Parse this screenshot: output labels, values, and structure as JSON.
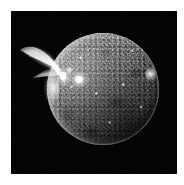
{
  "image": {
    "kind": "astronomical-photograph",
    "subject": "solar-disk-with-erupting-prominence",
    "color_mode": "grayscale",
    "background_color": "#ffffff",
    "frame_color": "#040404",
    "alt_text": "Grayscale solar image: mottled solar disk on a black field with a large wing-shaped prominence erupting from the upper-left limb"
  },
  "layout": {
    "canvas": {
      "width": 184,
      "height": 185
    },
    "frame": {
      "left": 11,
      "top": 11,
      "width": 166,
      "height": 163
    },
    "disk": {
      "center_x": 103,
      "center_y": 89,
      "radius": 56
    }
  },
  "features": {
    "disk_label": "solar disk",
    "prominence_label": "erupting prominence",
    "active_regions": [
      {
        "name": "bright plage (disk centre-left)",
        "x": 68,
        "y": 79,
        "brightness": "high"
      },
      {
        "name": "bright knot (near plage)",
        "x": 60,
        "y": 70,
        "brightness": "medium"
      },
      {
        "name": "bright region (east limb)",
        "x": 151,
        "y": 74,
        "brightness": "high"
      },
      {
        "name": "bright west limb patch",
        "x": 52,
        "y": 88,
        "brightness": "medium-high"
      }
    ],
    "limb_note": "west (left) limb shows enhanced brightening at the prominence footpoint",
    "shading_note": "upper-left of disk brighter; lower-right falls off to near black"
  },
  "palette": {
    "background": "#ffffff",
    "field": "#040404",
    "disk_mid": "#6a6a6a",
    "disk_bright": "#ffffff",
    "disk_dark": "#1a1a1a",
    "prominence": "#d8d8d8"
  }
}
